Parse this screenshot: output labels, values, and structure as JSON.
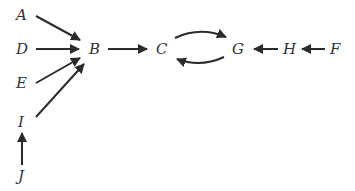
{
  "diagram": {
    "type": "directed-graph",
    "nodes": [
      {
        "id": "A",
        "label": "A",
        "x": 22,
        "y": 20
      },
      {
        "id": "D",
        "label": "D",
        "x": 22,
        "y": 54
      },
      {
        "id": "E",
        "label": "E",
        "x": 22,
        "y": 88
      },
      {
        "id": "I",
        "label": "I",
        "x": 22,
        "y": 128
      },
      {
        "id": "J",
        "label": "J",
        "x": 22,
        "y": 181
      },
      {
        "id": "B",
        "label": "B",
        "x": 95,
        "y": 54
      },
      {
        "id": "C",
        "label": "C",
        "x": 162,
        "y": 54
      },
      {
        "id": "G",
        "label": "G",
        "x": 238,
        "y": 54
      },
      {
        "id": "H",
        "label": "H",
        "x": 290,
        "y": 54
      },
      {
        "id": "F",
        "label": "F",
        "x": 335,
        "y": 54
      }
    ],
    "edges": [
      {
        "from": "A",
        "to": "B"
      },
      {
        "from": "D",
        "to": "B"
      },
      {
        "from": "E",
        "to": "B"
      },
      {
        "from": "I",
        "to": "B"
      },
      {
        "from": "J",
        "to": "I"
      },
      {
        "from": "B",
        "to": "C"
      },
      {
        "from": "C",
        "to": "G",
        "curve": "upper"
      },
      {
        "from": "G",
        "to": "C",
        "curve": "lower"
      },
      {
        "from": "H",
        "to": "G"
      },
      {
        "from": "F",
        "to": "H"
      }
    ]
  },
  "labels": {
    "A": "A",
    "B": "B",
    "C": "C",
    "D": "D",
    "E": "E",
    "F": "F",
    "G": "G",
    "H": "H",
    "I": "I",
    "J": "J"
  }
}
